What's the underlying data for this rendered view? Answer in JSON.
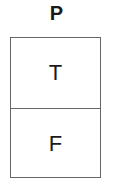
{
  "table": {
    "header": "P",
    "rows": [
      "T",
      "F"
    ]
  }
}
